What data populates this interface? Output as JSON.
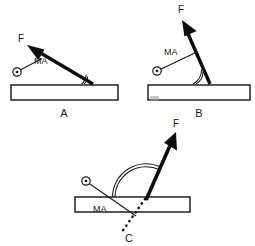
{
  "figure": {
    "background_color": "#ffffff",
    "ink_color": "#111111",
    "width": 255,
    "height": 246
  },
  "labels": {
    "force": "F",
    "moment_arm": "MA"
  },
  "panels": [
    {
      "id": "A",
      "label": "A",
      "label_pos": {
        "x": 64,
        "y": 115
      },
      "bar": {
        "x": 11,
        "y": 85,
        "width": 107,
        "height": 15
      },
      "pivot": {
        "x": 17,
        "y": 72,
        "radius": 4.2
      },
      "force": {
        "tail": {
          "x": 93,
          "y": 84
        },
        "tip": {
          "x": 27,
          "y": 45
        },
        "label_pos": {
          "x": 29,
          "y": 40
        },
        "shaft_width": 3.4,
        "head_length": 15,
        "head_width": 11
      },
      "moment_arm": {
        "from": {
          "x": 17,
          "y": 72
        },
        "to": {
          "x": 40,
          "y": 60
        },
        "label_pos": {
          "x": 33,
          "y": 62
        }
      },
      "angle_arc": {
        "vertex": {
          "x": 93,
          "y": 84
        },
        "radius": 11,
        "count": 2,
        "acute": true
      }
    },
    {
      "id": "B",
      "label": "B",
      "label_pos": {
        "x": 199,
        "y": 115
      },
      "bar": {
        "x": 148,
        "y": 85,
        "width": 102,
        "height": 15
      },
      "pivot": {
        "x": 157,
        "y": 71,
        "radius": 4.2
      },
      "force": {
        "tail": {
          "x": 210,
          "y": 84
        },
        "tip": {
          "x": 182,
          "y": 20
        },
        "label_pos": {
          "x": 181,
          "y": 12
        },
        "shaft_width": 3.4,
        "head_length": 16,
        "head_width": 11
      },
      "moment_arm": {
        "from": {
          "x": 157,
          "y": 71
        },
        "to": {
          "x": 196,
          "y": 53
        },
        "label_pos": {
          "x": 166,
          "y": 53
        }
      },
      "angle_arc": {
        "vertex": {
          "x": 210,
          "y": 84
        },
        "radius": 17,
        "count": 2,
        "acute": true
      },
      "smudge": {
        "x": 150,
        "y": 96,
        "width": 9,
        "height": 5
      }
    },
    {
      "id": "C",
      "label": "C",
      "label_pos": {
        "x": 129,
        "y": 240
      },
      "bar": {
        "x": 75,
        "y": 197,
        "width": 115,
        "height": 15
      },
      "pivot": {
        "x": 86,
        "y": 181,
        "radius": 4.2
      },
      "force": {
        "tail": {
          "x": 146,
          "y": 200
        },
        "tip": {
          "x": 176,
          "y": 132
        },
        "label_pos": {
          "x": 175,
          "y": 126
        },
        "shaft_width": 3.6,
        "head_length": 17,
        "head_width": 12
      },
      "force_extension_dotted": {
        "from": {
          "x": 146,
          "y": 200
        },
        "to": {
          "x": 122,
          "y": 232
        }
      },
      "moment_arm": {
        "from": {
          "x": 86,
          "y": 181
        },
        "to": {
          "x": 135,
          "y": 215
        },
        "label_pos": {
          "x": 102,
          "y": 211
        }
      },
      "angle_arc": {
        "vertex": {
          "x": 146,
          "y": 200
        },
        "radius": 33,
        "count": 2,
        "acute": false
      }
    }
  ]
}
